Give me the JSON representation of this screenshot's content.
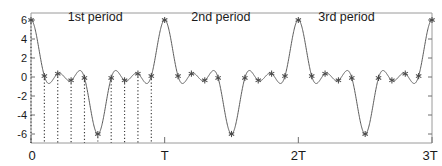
{
  "figure": {
    "background_color": "#ffffff",
    "frame_color": "#9a9a9a",
    "curve_color": "#5b5b5b",
    "stem_color": "#3a3a3a",
    "marker_color": "#4a4a4a"
  },
  "annotations": {
    "period1": "1st period",
    "period2": "2nd period",
    "period3": "3rd  period"
  },
  "chart_data": {
    "type": "line",
    "title": "",
    "xlabel": "",
    "ylabel": "",
    "grid": false,
    "legend": false,
    "xlim": [
      0,
      3
    ],
    "ylim": [
      -7,
      7
    ],
    "xtick_labels": [
      "0",
      "T",
      "2T",
      "3T"
    ],
    "xtick_values": [
      0,
      1,
      2,
      3
    ],
    "ytick_labels": [
      "6",
      "4",
      "2",
      "0",
      "-2",
      "-4",
      "-6"
    ],
    "ytick_values": [
      6,
      4,
      2,
      0,
      -2,
      -4,
      -6
    ],
    "annotations": [
      {
        "text": "1st period",
        "x": 0.48,
        "y": 6.3
      },
      {
        "text": "2nd period",
        "x": 1.42,
        "y": 6.3
      },
      {
        "text": "3rd  period",
        "x": 2.36,
        "y": 6.3
      }
    ],
    "periods": 3,
    "samples_per_period": 10,
    "stem_periods": 1,
    "harmonics": [
      {
        "amplitude": 2.55,
        "cycles_per_period": 1.0,
        "phase_deg": 90
      },
      {
        "amplitude": 2.15,
        "cycles_per_period": 3.0,
        "phase_deg": 90
      },
      {
        "amplitude": 1.3,
        "cycles_per_period": 5.0,
        "phase_deg": 90
      }
    ],
    "offset": 0.0,
    "sample_x_normalized": [
      0.0,
      0.1,
      0.2,
      0.3,
      0.4,
      0.5,
      0.6,
      0.7,
      0.8,
      0.9
    ],
    "sample_values": [
      6.0,
      -2.35,
      1.05,
      -1.45,
      2.35,
      -2.7,
      -2.7,
      2.35,
      -1.45,
      1.05
    ],
    "series": [
      {
        "name": "x(t)",
        "x": [
          0.0,
          0.1,
          0.2,
          0.3,
          0.4,
          0.5,
          0.6,
          0.7,
          0.8,
          0.9,
          1.0,
          1.1,
          1.2,
          1.3,
          1.4,
          1.5,
          1.6,
          1.7,
          1.8,
          1.9,
          2.0,
          2.1,
          2.2,
          2.3,
          2.4,
          2.5,
          2.6,
          2.7,
          2.8,
          2.9,
          3.0
        ],
        "values": [
          6.0,
          -2.35,
          1.05,
          -1.45,
          2.35,
          -2.7,
          -2.7,
          2.35,
          -1.45,
          1.05,
          -2.35,
          6.0,
          -2.35,
          1.05,
          -1.45,
          2.35,
          -2.7,
          -2.7,
          2.35,
          -1.45,
          1.05,
          -2.35,
          6.0,
          -2.35,
          1.05,
          -1.45,
          2.35,
          -2.7,
          -2.7,
          2.35,
          6.0
        ]
      }
    ]
  },
  "geometry": {
    "plot_left": 31,
    "plot_right": 432,
    "plot_top": 13,
    "plot_bottom": 143,
    "y_zero_px": 77,
    "px_per_unit_y": 9.5
  }
}
